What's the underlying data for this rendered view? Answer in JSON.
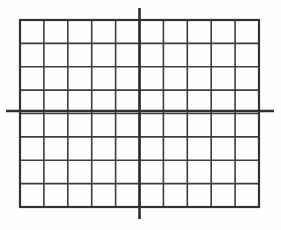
{
  "figure": {
    "kind": "coordinate-grid",
    "title": "",
    "background_color": "#fefefd",
    "width": 281,
    "height": 230
  },
  "chart_data": {
    "type": "scatter",
    "title": "",
    "subtitle": "",
    "xlabel": "",
    "ylabel": "",
    "series": [
      {
        "name": "",
        "x": [],
        "y": []
      }
    ],
    "x": [],
    "values": [],
    "categories": [],
    "grid": true,
    "legend": false,
    "legend_position": "none",
    "annotations": [],
    "tick_labels": {
      "x": [],
      "y": []
    },
    "xlim": [
      -5,
      5
    ],
    "ylim": [
      -4,
      4
    ],
    "axis_origin": {
      "x": 0,
      "y": 0
    },
    "grid_columns": 10,
    "grid_rows": 8,
    "cells_left_of_y_axis": 5,
    "cells_right_of_y_axis": 5,
    "cells_above_x_axis": 4,
    "cells_below_x_axis": 4,
    "data_points": []
  },
  "geometry": {
    "grid_left": 20,
    "grid_top": 20,
    "grid_right": 259,
    "grid_bottom": 207,
    "cell_width": 23.9,
    "cell_height": 23.375,
    "y_axis_x": 139.5,
    "x_axis_y": 111.0,
    "y_axis_top": 8,
    "y_axis_bottom": 219,
    "x_axis_left": 6,
    "x_axis_right": 274
  },
  "style": {
    "grid_line_color": "#3d3d3d",
    "axis_line_color": "#2e2e2e",
    "border_line_color": "#333333",
    "grid_line_width": 1.6,
    "axis_line_width": 2.6,
    "border_line_width": 2.2
  },
  "elements": {
    "grid_name": "coordinate-grid",
    "x_axis_name": "x-axis-line",
    "y_axis_name": "y-axis-line",
    "border_name": "grid-border"
  }
}
